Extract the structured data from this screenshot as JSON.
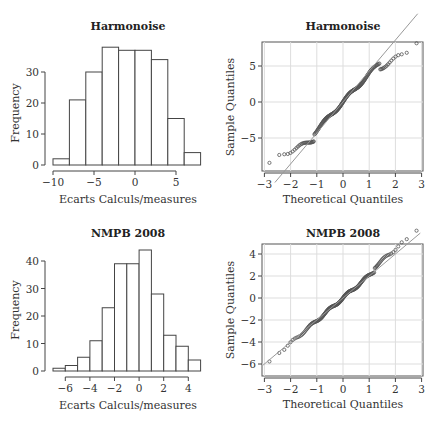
{
  "chart_data": [
    {
      "type": "bar",
      "subtype": "histogram",
      "title": "Harmonoise",
      "xlabel": "Ecarts Calculs/measures",
      "ylabel": "Frequency",
      "bin_edges": [
        -10,
        -8,
        -6,
        -4,
        -2,
        0,
        2,
        4,
        6,
        8
      ],
      "values": [
        2,
        21,
        30,
        38,
        37,
        37,
        34,
        15,
        4
      ],
      "xticks": [
        -10,
        -5,
        0,
        5
      ],
      "yticks": [
        0,
        10,
        20,
        30
      ],
      "xlim": [
        -10,
        8
      ],
      "ylim": [
        0,
        38
      ],
      "grid": false
    },
    {
      "type": "scatter",
      "subtype": "qqplot",
      "title": "Harmonoise",
      "xlabel": "Theoretical Quantiles",
      "ylabel": "Sample Quantiles",
      "xticks": [
        -3,
        -2,
        -1,
        0,
        1,
        2,
        3
      ],
      "yticks": [
        -5,
        0,
        5
      ],
      "xlim": [
        -3,
        3
      ],
      "ylim": [
        -9,
        8.5
      ],
      "grid": true,
      "reference_line": {
        "slope": 4.3,
        "intercept": 0
      }
    },
    {
      "type": "bar",
      "subtype": "histogram",
      "title": "NMPB 2008",
      "xlabel": "Ecarts Calculs/measures",
      "ylabel": "Frequency",
      "bin_edges": [
        -7,
        -6,
        -5,
        -4,
        -3,
        -2,
        -1,
        0,
        1,
        2,
        3,
        4,
        5
      ],
      "values": [
        1,
        2,
        5,
        11,
        23,
        39,
        39,
        44,
        28,
        13,
        9,
        4
      ],
      "xticks": [
        -6,
        -4,
        -2,
        0,
        2,
        4
      ],
      "yticks": [
        0,
        10,
        20,
        30,
        40
      ],
      "xlim": [
        -7,
        5
      ],
      "ylim": [
        0,
        44
      ],
      "grid": false
    },
    {
      "type": "scatter",
      "subtype": "qqplot",
      "title": "NMPB 2008",
      "xlabel": "Theoretical Quantiles",
      "ylabel": "Sample Quantiles",
      "xticks": [
        -3,
        -2,
        -1,
        0,
        1,
        2,
        3
      ],
      "yticks": [
        -6,
        -4,
        -2,
        0,
        2,
        4
      ],
      "xlim": [
        -3,
        3
      ],
      "ylim": [
        -7,
        5
      ],
      "grid": true,
      "reference_line": {
        "slope": 2.0,
        "intercept": 0
      }
    }
  ],
  "labels": {
    "h1": {
      "title": "Harmonoise",
      "xlabel": "Ecarts Calculs/measures",
      "ylabel": "Frequency"
    },
    "q1": {
      "title": "Harmonoise",
      "xlabel": "Theoretical Quantiles",
      "ylabel": "Sample Quantiles"
    },
    "h2": {
      "title": "NMPB 2008",
      "xlabel": "Ecarts Calculs/measures",
      "ylabel": "Frequency"
    },
    "q2": {
      "title": "NMPB 2008",
      "xlabel": "Theoretical Quantiles",
      "ylabel": "Sample Quantiles"
    }
  }
}
